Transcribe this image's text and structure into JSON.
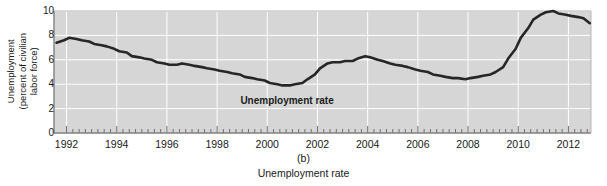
{
  "figure": {
    "panel_letter": "(b)",
    "caption": "Unemployment rate",
    "background_color": "#ffffff",
    "plot_background_color": "#d6d6d6",
    "grid_color": "#ffffff",
    "line_color": "#262626",
    "axis_color": "#808080"
  },
  "chart_data": {
    "type": "line",
    "title": "Unemployment rate",
    "xlabel": "",
    "ylabel": "Unemployment (percent of civilian labor force)",
    "ylabel_lines": [
      "Unemployment",
      "(percent of civilian",
      "labor force)"
    ],
    "ylim": [
      0,
      10
    ],
    "xlim": [
      1991.5,
      2012.9
    ],
    "yticks": [
      0,
      2,
      4,
      6,
      8,
      10
    ],
    "ytick_labels": [
      "0",
      "2",
      "4",
      "6",
      "8",
      "10"
    ],
    "xticks": [
      1992,
      1994,
      1996,
      1998,
      2000,
      2002,
      2004,
      2006,
      2008,
      2010,
      2012
    ],
    "xtick_labels": [
      "1992",
      "1994",
      "1996",
      "1998",
      "2000",
      "2002",
      "2004",
      "2006",
      "2008",
      "2010",
      "2012"
    ],
    "minor_tick_interval": 0.25,
    "grid": true,
    "grid_axis": "both",
    "legend": false,
    "annotations": [
      {
        "text": "Unemployment rate",
        "x": 2001.0,
        "y": 2.6,
        "bold": true
      }
    ],
    "series": [
      {
        "name": "Unemployment rate",
        "units": "percent of civilian labor force",
        "x": [
          1991.6,
          1991.9,
          1992.1,
          1992.4,
          1992.6,
          1992.9,
          1993.1,
          1993.4,
          1993.6,
          1993.9,
          1994.1,
          1994.4,
          1994.6,
          1994.9,
          1995.1,
          1995.4,
          1995.6,
          1995.9,
          1996.1,
          1996.4,
          1996.6,
          1996.9,
          1997.1,
          1997.4,
          1997.6,
          1997.9,
          1998.1,
          1998.4,
          1998.6,
          1998.9,
          1999.1,
          1999.4,
          1999.6,
          1999.9,
          2000.1,
          2000.4,
          2000.6,
          2000.9,
          2001.1,
          2001.4,
          2001.6,
          2001.9,
          2002.1,
          2002.4,
          2002.6,
          2002.9,
          2003.1,
          2003.4,
          2003.6,
          2003.9,
          2004.1,
          2004.4,
          2004.6,
          2004.9,
          2005.1,
          2005.4,
          2005.6,
          2005.9,
          2006.1,
          2006.4,
          2006.6,
          2006.9,
          2007.1,
          2007.4,
          2007.6,
          2007.9,
          2008.1,
          2008.4,
          2008.6,
          2008.9,
          2009.1,
          2009.4,
          2009.6,
          2009.9,
          2010.1,
          2010.4,
          2010.6,
          2010.9,
          2011.1,
          2011.4,
          2011.6,
          2011.9,
          2012.1,
          2012.4,
          2012.6,
          2012.85
        ],
        "y": [
          7.4,
          7.6,
          7.8,
          7.7,
          7.6,
          7.5,
          7.3,
          7.2,
          7.1,
          6.9,
          6.7,
          6.6,
          6.3,
          6.2,
          6.1,
          6.0,
          5.8,
          5.7,
          5.6,
          5.6,
          5.7,
          5.6,
          5.5,
          5.4,
          5.3,
          5.2,
          5.1,
          5.0,
          4.9,
          4.8,
          4.6,
          4.5,
          4.4,
          4.3,
          4.1,
          4.0,
          3.9,
          3.9,
          4.0,
          4.1,
          4.4,
          4.8,
          5.3,
          5.7,
          5.8,
          5.8,
          5.9,
          5.9,
          6.1,
          6.3,
          6.2,
          6.0,
          5.9,
          5.7,
          5.6,
          5.5,
          5.4,
          5.2,
          5.1,
          5.0,
          4.8,
          4.7,
          4.6,
          4.5,
          4.5,
          4.4,
          4.5,
          4.6,
          4.7,
          4.8,
          5.0,
          5.4,
          6.1,
          6.9,
          7.8,
          8.6,
          9.3,
          9.7,
          9.9,
          10.0,
          9.8,
          9.7,
          9.6,
          9.5,
          9.4,
          9.0
        ]
      }
    ]
  }
}
